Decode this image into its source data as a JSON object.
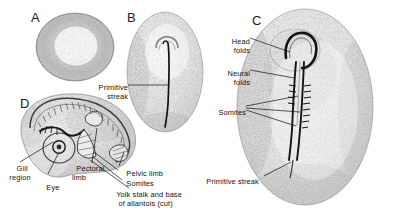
{
  "figure": {
    "background_color": "#ffffff",
    "ink_color": "#111111",
    "stipple_color": "#6d6d6d"
  },
  "panels": [
    {
      "id": "A",
      "letter": "A",
      "name": "blastoderm-disc"
    },
    {
      "id": "B",
      "letter": "B",
      "name": "primitive-streak-stage"
    },
    {
      "id": "C",
      "letter": "C",
      "name": "neural-fold-somite-stage"
    },
    {
      "id": "D",
      "letter": "D",
      "name": "limb-bud-stage"
    }
  ],
  "labels": {
    "primitive_streak_b": "Primitive\nstreak",
    "head_folds": "Head\nfolds",
    "neural_folds": "Neural\nfolds",
    "somites_c": "Somites",
    "primitive_streak_c": "Primitive streak",
    "gill_region": "Gill\nregion",
    "eye": "Eye",
    "pectoral_limb": "Pectoral\nlimb",
    "pelvic_limb": "Pelvic limb",
    "somites_d": "Somites",
    "yolk_stalk": "Yolk stalk and base\n   of allantois (cut)"
  }
}
